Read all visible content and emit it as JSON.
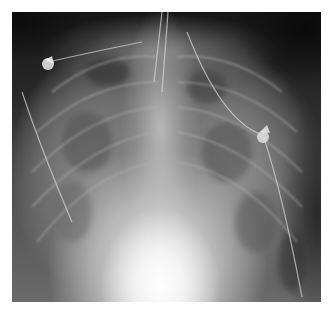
{
  "image": {
    "subject": "frontal chest radiograph",
    "alt": "Frontal chest X-ray with bilateral diffuse opacities, ECG electrodes and lines overlying the chest, enlarged cardiac silhouette",
    "frame": {
      "x": 12,
      "y": 12,
      "width": 309,
      "height": 290
    },
    "colors": {
      "background": "#ffffff",
      "film_dark": "#1a1a1a",
      "soft_tissue": "#8a8a8a",
      "heart_bright": "#f5f5f5"
    },
    "features": [
      {
        "name": "ecg-electrode-left",
        "x": 48,
        "y": 62
      },
      {
        "name": "ecg-electrode-right",
        "x": 263,
        "y": 135
      },
      {
        "name": "cardiac-silhouette",
        "x": 165,
        "y": 260
      },
      {
        "name": "trachea-lines",
        "x": 160,
        "y": 60
      }
    ]
  }
}
